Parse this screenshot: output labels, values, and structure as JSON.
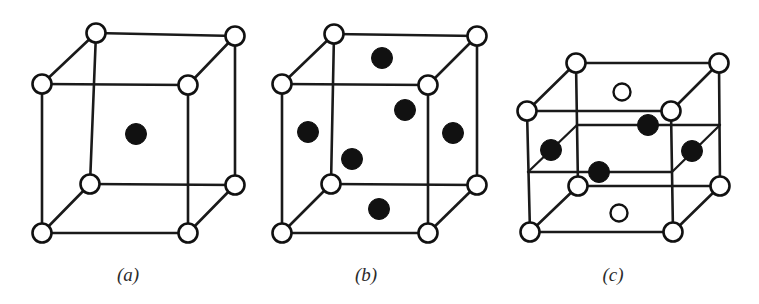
{
  "figure": {
    "background_color": "#ffffff",
    "line_color": "#1a1a1a",
    "filled_atom_color": "#111111",
    "open_atom_color": "#ffffff",
    "width": 759,
    "height": 304
  },
  "panels": [
    {
      "id": "a",
      "label": "(a)",
      "label_x": 128,
      "label_y": 281,
      "structure": "body-centered cubic",
      "corner_atoms": 8,
      "interior_atoms": 1,
      "cube": {
        "front_top_left": {
          "x": 42,
          "y": 84
        },
        "front_top_right": {
          "x": 188,
          "y": 85
        },
        "front_bottom_left": {
          "x": 42,
          "y": 233
        },
        "front_bottom_right": {
          "x": 188,
          "y": 233
        },
        "back_top_left": {
          "x": 96,
          "y": 33
        },
        "back_top_right": {
          "x": 235,
          "y": 36
        },
        "back_bottom_left": {
          "x": 90,
          "y": 184
        },
        "back_bottom_right": {
          "x": 235,
          "y": 185
        }
      },
      "corner_radius": 9.5,
      "filled_atoms": [
        {
          "name": "body-center-atom",
          "x": 136,
          "y": 134,
          "r": 10.5
        }
      ],
      "open_atoms": []
    },
    {
      "id": "b",
      "label": "(b)",
      "label_x": 366,
      "label_y": 281,
      "structure": "face-centered cubic",
      "corner_atoms": 8,
      "interior_atoms": 6,
      "cube": {
        "front_top_left": {
          "x": 282,
          "y": 84
        },
        "front_top_right": {
          "x": 428,
          "y": 85
        },
        "front_bottom_left": {
          "x": 282,
          "y": 233
        },
        "front_bottom_right": {
          "x": 428,
          "y": 233
        },
        "back_top_left": {
          "x": 334,
          "y": 34
        },
        "back_top_right": {
          "x": 477,
          "y": 36
        },
        "back_bottom_left": {
          "x": 331,
          "y": 184
        },
        "back_bottom_right": {
          "x": 477,
          "y": 185
        }
      },
      "corner_radius": 9.5,
      "filled_atoms": [
        {
          "name": "top-face-atom",
          "x": 382,
          "y": 58,
          "r": 10.5
        },
        {
          "name": "back-face-atom",
          "x": 405,
          "y": 110,
          "r": 10.5
        },
        {
          "name": "left-face-atom",
          "x": 308,
          "y": 132,
          "r": 10.5
        },
        {
          "name": "right-face-atom",
          "x": 453,
          "y": 133,
          "r": 10.5
        },
        {
          "name": "front-face-atom",
          "x": 352,
          "y": 159,
          "r": 10.5
        },
        {
          "name": "bottom-face-atom",
          "x": 379,
          "y": 209,
          "r": 10.5
        }
      ],
      "open_atoms": []
    },
    {
      "id": "c",
      "label": "(c)",
      "label_x": 613,
      "label_y": 281,
      "structure": "face-centered tetragonal with mid-plane atoms",
      "corner_atoms": 8,
      "interior_atoms": 4,
      "cube": {
        "front_top_left": {
          "x": 527,
          "y": 111
        },
        "front_top_right": {
          "x": 671,
          "y": 111
        },
        "front_bottom_left": {
          "x": 530,
          "y": 232
        },
        "front_bottom_right": {
          "x": 673,
          "y": 232
        },
        "back_top_left": {
          "x": 576,
          "y": 63
        },
        "back_top_right": {
          "x": 719,
          "y": 63
        },
        "back_bottom_left": {
          "x": 578,
          "y": 186
        },
        "back_bottom_right": {
          "x": 720,
          "y": 186
        }
      },
      "mid_plane": {
        "front_left": {
          "x": 528,
          "y": 172
        },
        "front_right": {
          "x": 672,
          "y": 172
        },
        "back_left": {
          "x": 577,
          "y": 125
        },
        "back_right": {
          "x": 720,
          "y": 125
        }
      },
      "corner_radius": 9.5,
      "filled_atoms": [
        {
          "name": "mid-back-atom",
          "x": 648,
          "y": 125,
          "r": 10.5
        },
        {
          "name": "mid-left-atom",
          "x": 551,
          "y": 150,
          "r": 10.5
        },
        {
          "name": "mid-right-atom",
          "x": 692,
          "y": 151,
          "r": 10.5
        },
        {
          "name": "mid-front-atom",
          "x": 599,
          "y": 172,
          "r": 10.5
        }
      ],
      "open_atoms": [
        {
          "name": "top-face-open-atom",
          "x": 622,
          "y": 92,
          "r": 8.5
        },
        {
          "name": "bottom-face-open-atom",
          "x": 619,
          "y": 213,
          "r": 8.5
        }
      ]
    }
  ]
}
